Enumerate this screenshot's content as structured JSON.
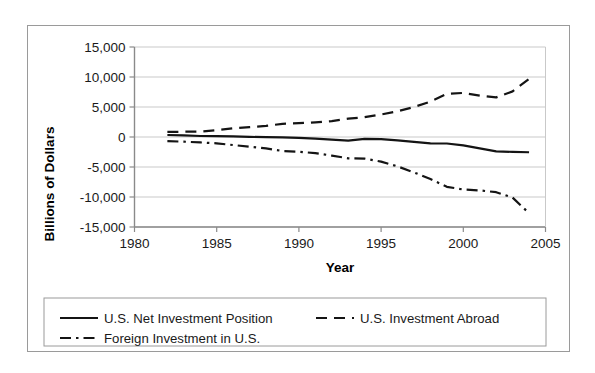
{
  "chart_data": {
    "type": "line",
    "title": "",
    "xlabel": "Year",
    "ylabel": "Billions of Dollars",
    "xlim": [
      1980,
      2005
    ],
    "ylim": [
      -15000,
      15000
    ],
    "xticks": [
      "1980",
      "1985",
      "1990",
      "1995",
      "2000",
      "2005"
    ],
    "xtick_values": [
      1980,
      1985,
      1990,
      1995,
      2000,
      2005
    ],
    "yticks": [
      "15,000",
      "10,000",
      "5,000",
      "0",
      "-5,000",
      "-10,000",
      "-15,000"
    ],
    "ytick_values": [
      15000,
      10000,
      5000,
      0,
      -5000,
      -10000,
      -15000
    ],
    "grid": true,
    "legend_position": "below-plot",
    "x": [
      1982,
      1983,
      1984,
      1985,
      1986,
      1987,
      1988,
      1989,
      1990,
      1991,
      1992,
      1993,
      1994,
      1995,
      1996,
      1997,
      1998,
      1999,
      2000,
      2001,
      2002,
      2003,
      2004
    ],
    "series": [
      {
        "name": "U.S. Net Investment Position",
        "linestyle": "solid",
        "color": "#141414",
        "values": [
          330,
          270,
          170,
          140,
          100,
          20,
          -30,
          -60,
          -160,
          -260,
          -450,
          -600,
          -300,
          -350,
          -560,
          -820,
          -1070,
          -1080,
          -1390,
          -1890,
          -2390,
          -2480,
          -2540
        ]
      },
      {
        "name": "U.S. Investment Abroad",
        "linestyle": "dashed",
        "color": "#141414",
        "values": [
          840,
          880,
          900,
          1150,
          1450,
          1650,
          1850,
          2200,
          2300,
          2450,
          2650,
          3050,
          3300,
          3750,
          4300,
          5000,
          5900,
          7200,
          7350,
          6900,
          6600,
          7600,
          9700
        ]
      },
      {
        "name": "Foreign Investment in U.S.",
        "linestyle": "dashdot",
        "color": "#141414",
        "values": [
          -690,
          -780,
          -900,
          -1060,
          -1340,
          -1630,
          -1900,
          -2330,
          -2450,
          -2700,
          -3100,
          -3550,
          -3600,
          -4100,
          -4900,
          -5900,
          -7000,
          -8300,
          -8750,
          -8900,
          -9200,
          -10100,
          -12700
        ]
      }
    ]
  },
  "axis": {
    "y_title": "Billions of Dollars",
    "x_title": "Year"
  },
  "legend": {
    "items": [
      {
        "label": "U.S. Net Investment Position",
        "style": "solid"
      },
      {
        "label": "U.S. Investment Abroad",
        "style": "dashed"
      },
      {
        "label": "Foreign Investment in U.S.",
        "style": "dashdot"
      }
    ]
  }
}
